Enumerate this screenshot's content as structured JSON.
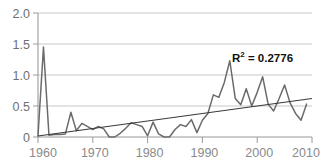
{
  "chart_data": {
    "type": "line",
    "title": "",
    "xlabel": "",
    "ylabel": "",
    "xlim": [
      1960,
      2010
    ],
    "ylim": [
      0,
      2.0
    ],
    "xticks": [
      "1960",
      "1970",
      "1980",
      "1990",
      "2000",
      "2010"
    ],
    "xtick_values": [
      1960,
      1970,
      1980,
      1990,
      2000,
      2010
    ],
    "yticks": [
      "0",
      "0.5",
      "1.0",
      "1.5",
      "2.0"
    ],
    "ytick_values": [
      0,
      0.5,
      1.0,
      1.5,
      2.0
    ],
    "grid": true,
    "legend": "none",
    "annotations": [
      {
        "name": "r-squared",
        "prefix": "R",
        "superscript": "2",
        "text": " = 0.2776",
        "value": 0.2776
      }
    ],
    "series": [
      {
        "name": "observed",
        "color": "#6b6b6b",
        "x": [
          1960,
          1961,
          1962,
          1963,
          1964,
          1965,
          1966,
          1967,
          1968,
          1969,
          1970,
          1971,
          1972,
          1973,
          1974,
          1975,
          1976,
          1977,
          1978,
          1979,
          1980,
          1981,
          1982,
          1983,
          1984,
          1985,
          1986,
          1987,
          1988,
          1989,
          1990,
          1991,
          1992,
          1993,
          1994,
          1995,
          1996,
          1997,
          1998,
          1999,
          2000,
          2001,
          2002,
          2003,
          2004,
          2005,
          2006,
          2007,
          2008,
          2009
        ],
        "values": [
          0.02,
          1.45,
          0.03,
          0.04,
          0.04,
          0.05,
          0.4,
          0.1,
          0.22,
          0.17,
          0.12,
          0.17,
          0.13,
          0.0,
          0.0,
          0.06,
          0.14,
          0.23,
          0.2,
          0.17,
          0.02,
          0.24,
          0.05,
          0.0,
          0.0,
          0.12,
          0.2,
          0.17,
          0.28,
          0.07,
          0.27,
          0.38,
          0.68,
          0.64,
          0.88,
          1.23,
          0.62,
          0.52,
          0.78,
          0.5,
          0.72,
          0.97,
          0.53,
          0.42,
          0.62,
          0.84,
          0.55,
          0.38,
          0.27,
          0.53
        ]
      },
      {
        "name": "linear-trendline",
        "color": "#3a3a3a",
        "x": [
          1960,
          2010
        ],
        "values": [
          0.015,
          0.62
        ]
      }
    ]
  }
}
